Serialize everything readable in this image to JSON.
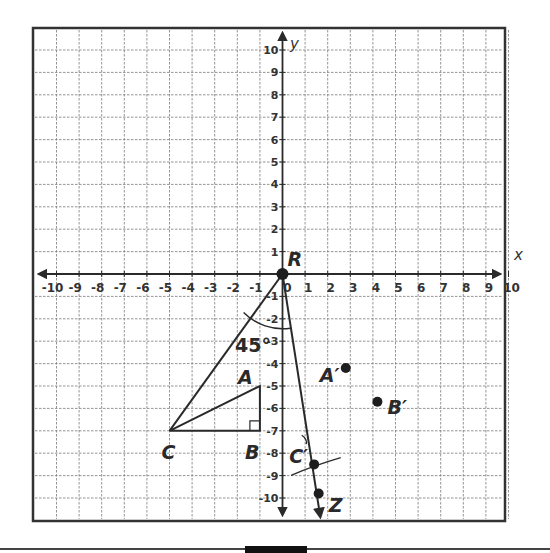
{
  "diagram": {
    "type": "coordinate-plane-rotation",
    "axes": {
      "x_label": "x",
      "y_label": "y",
      "x_ticks": [
        "-10",
        "-9",
        "-8",
        "-7",
        "-6",
        "-5",
        "-4",
        "-3",
        "-2",
        "-1",
        "0",
        "1",
        "2",
        "3",
        "4",
        "5",
        "6",
        "7",
        "8",
        "9",
        "10"
      ],
      "y_ticks": [
        "10",
        "9",
        "8",
        "7",
        "6",
        "5",
        "4",
        "3",
        "2",
        "1",
        "-1",
        "-2",
        "-3",
        "-4",
        "-5",
        "-6",
        "-7",
        "-8",
        "-9",
        "-10"
      ],
      "range": [
        -10,
        10
      ]
    },
    "points": {
      "R": {
        "label": "R",
        "x": 0,
        "y": 0
      },
      "A": {
        "label": "A",
        "x": -1,
        "y": -5
      },
      "B": {
        "label": "B",
        "x": -1,
        "y": -7
      },
      "C": {
        "label": "C",
        "x": -5,
        "y": -7
      },
      "A_prime": {
        "label": "A′",
        "x": 2.8,
        "y": -4.2
      },
      "B_prime": {
        "label": "B′",
        "x": 4.2,
        "y": -5.7
      },
      "C_prime": {
        "label": "C′",
        "x": 1.4,
        "y": -8.5
      },
      "Z": {
        "label": "Z",
        "x": 1.6,
        "y": -9.8
      }
    },
    "angle_label": "45°",
    "right_angle_at": "B"
  }
}
